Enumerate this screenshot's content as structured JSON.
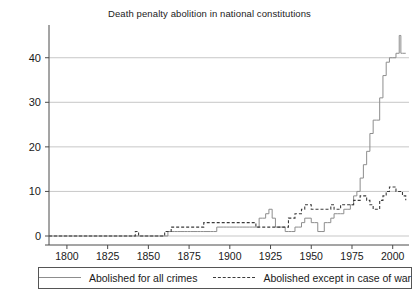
{
  "chart_data": {
    "type": "line",
    "title": "Death penalty abolition in national constitutions",
    "xlabel": "",
    "ylabel": "",
    "xlim": [
      1789,
      2010
    ],
    "ylim": [
      0,
      46
    ],
    "grid": true,
    "legend_position": "bottom",
    "xticks": [
      1800,
      1825,
      1850,
      1875,
      1900,
      1925,
      1950,
      1975,
      2000
    ],
    "yticks": [
      0,
      10,
      20,
      30,
      40
    ],
    "series": [
      {
        "name": "Abolished for all crimes",
        "style": "solid",
        "color": "#8d8d8d",
        "x": [
          1789,
          1800,
          1810,
          1820,
          1830,
          1840,
          1845,
          1850,
          1855,
          1858,
          1860,
          1862,
          1864,
          1866,
          1868,
          1870,
          1872,
          1874,
          1876,
          1878,
          1880,
          1882,
          1884,
          1886,
          1888,
          1890,
          1892,
          1894,
          1896,
          1898,
          1900,
          1902,
          1904,
          1906,
          1908,
          1910,
          1912,
          1914,
          1916,
          1918,
          1920,
          1922,
          1924,
          1926,
          1928,
          1930,
          1932,
          1934,
          1936,
          1938,
          1940,
          1942,
          1944,
          1946,
          1948,
          1950,
          1952,
          1954,
          1956,
          1958,
          1960,
          1962,
          1964,
          1966,
          1968,
          1970,
          1972,
          1974,
          1976,
          1978,
          1980,
          1982,
          1984,
          1986,
          1988,
          1990,
          1992,
          1994,
          1996,
          1998,
          2000,
          2002,
          2004,
          2005,
          2006,
          2008
        ],
        "y": [
          0,
          0,
          0,
          0,
          0,
          0,
          0,
          0,
          0,
          0,
          0,
          1,
          1,
          1,
          1,
          1,
          1,
          1,
          1,
          1,
          1,
          1,
          1,
          1,
          1,
          1,
          2,
          2,
          2,
          2,
          2,
          2,
          2,
          2,
          2,
          2,
          2,
          2,
          2,
          4,
          4,
          5,
          6,
          4,
          2,
          2,
          2,
          1,
          1,
          1,
          2,
          2,
          3,
          4,
          4,
          3,
          3,
          1,
          1,
          3,
          3,
          4,
          5,
          5,
          5,
          6,
          6,
          7,
          9,
          10,
          13,
          16,
          19,
          23,
          26,
          26,
          31,
          36,
          39,
          40,
          40,
          41,
          45,
          41,
          41,
          41
        ]
      },
      {
        "name": "Abolished except in case of war",
        "style": "dashed",
        "color": "#3b3b3b",
        "x": [
          1789,
          1800,
          1810,
          1820,
          1830,
          1840,
          1842,
          1844,
          1850,
          1855,
          1858,
          1860,
          1862,
          1864,
          1866,
          1868,
          1870,
          1872,
          1874,
          1876,
          1878,
          1880,
          1882,
          1884,
          1886,
          1888,
          1890,
          1892,
          1894,
          1896,
          1898,
          1900,
          1902,
          1904,
          1906,
          1908,
          1910,
          1912,
          1914,
          1916,
          1918,
          1920,
          1922,
          1924,
          1926,
          1928,
          1930,
          1932,
          1934,
          1936,
          1938,
          1940,
          1942,
          1944,
          1946,
          1948,
          1950,
          1952,
          1954,
          1956,
          1958,
          1960,
          1962,
          1964,
          1966,
          1968,
          1970,
          1972,
          1974,
          1976,
          1978,
          1980,
          1982,
          1984,
          1986,
          1988,
          1990,
          1992,
          1994,
          1996,
          1998,
          2000,
          2002,
          2004,
          2006,
          2008
        ],
        "y": [
          0,
          0,
          0,
          0,
          0,
          0,
          1,
          0,
          0,
          0,
          0,
          1,
          1,
          2,
          2,
          2,
          2,
          2,
          2,
          2,
          2,
          2,
          2,
          3,
          3,
          3,
          3,
          3,
          3,
          3,
          3,
          3,
          3,
          3,
          3,
          3,
          3,
          3,
          3,
          2,
          2,
          2,
          2,
          2,
          2,
          2,
          2,
          2,
          2,
          4,
          4,
          5,
          5,
          6,
          7,
          7,
          6,
          6,
          6,
          6,
          6,
          6,
          7,
          6,
          6,
          7,
          7,
          7,
          7,
          8,
          8,
          9,
          9,
          8,
          7,
          6,
          6,
          8,
          9,
          10,
          11,
          11,
          10,
          10,
          9,
          8
        ]
      }
    ]
  },
  "legend": {
    "entries": [
      {
        "label": "Abolished for all crimes",
        "style": "solid"
      },
      {
        "label": "Abolished except in case of war",
        "style": "dashed"
      }
    ]
  }
}
